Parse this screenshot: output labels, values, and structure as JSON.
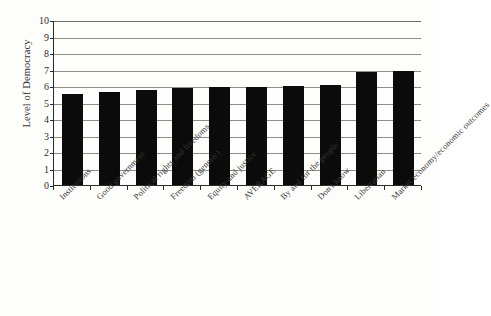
{
  "chart_data": {
    "type": "bar",
    "title": "",
    "xlabel": "",
    "ylabel": "Level of Democracy",
    "ylim": [
      0,
      10
    ],
    "ytick_labels": [
      "10",
      "9",
      "8",
      "7",
      "6",
      "5",
      "4",
      "3",
      "2",
      "1",
      "0"
    ],
    "yticks": [
      10,
      9,
      8,
      7,
      6,
      5,
      4,
      3,
      2,
      1,
      0
    ],
    "grid": true,
    "legend": "none",
    "bar_color": "#0b0b0b",
    "categories": [
      "Institutions",
      "Good government",
      "Political rights and freedoms",
      "Freedom (generic)",
      "Equity and justice",
      "AVERAGE",
      "By and for the people",
      "Don't know",
      "Libertarian",
      "Market economy/economic outcomes"
    ],
    "values": [
      5.5,
      5.65,
      5.75,
      5.9,
      5.95,
      5.95,
      6.0,
      6.05,
      6.85,
      6.9
    ]
  },
  "axes": {
    "y_title": "Level of Democracy"
  }
}
